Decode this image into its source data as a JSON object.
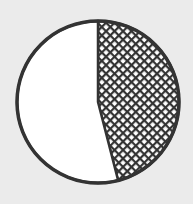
{
  "chart_data": {
    "type": "pie",
    "title": "",
    "start": "top",
    "direction": "clockwise",
    "slices": [
      {
        "label": "",
        "value": 46,
        "fill": "hatched"
      },
      {
        "label": "",
        "value": 54,
        "fill": "white"
      }
    ]
  },
  "colors": {
    "background": "#ebebeb",
    "outline": "#333333",
    "hatch": "#333333",
    "white": "#ffffff"
  }
}
